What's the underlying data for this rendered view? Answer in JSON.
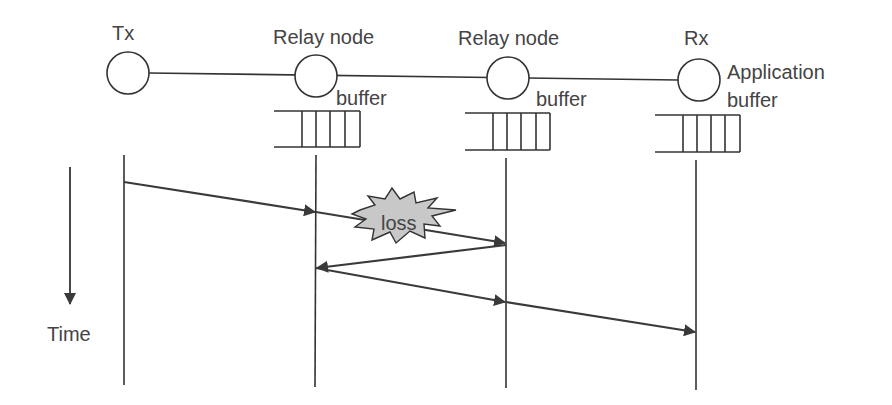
{
  "nodes": [
    {
      "id": "tx",
      "label": "Tx"
    },
    {
      "id": "relay1",
      "label": "Relay node",
      "buffer_label": "buffer"
    },
    {
      "id": "relay2",
      "label": "Relay node",
      "buffer_label": "buffer"
    },
    {
      "id": "rx",
      "label": "Rx",
      "buffer_label_line1": "Application",
      "buffer_label_line2": "buffer"
    }
  ],
  "time_axis": {
    "label": "Time"
  },
  "loss": {
    "label": "loss"
  },
  "messages": [
    {
      "from": "tx",
      "to": "relay1",
      "note": "packet"
    },
    {
      "from": "relay1",
      "to": "relay2",
      "note": "lost packet"
    },
    {
      "from": "relay2",
      "to": "relay1",
      "note": "feedback"
    },
    {
      "from": "relay1",
      "to": "relay2",
      "note": "retransmission"
    },
    {
      "from": "relay2",
      "to": "rx",
      "note": "forward"
    }
  ],
  "colors": {
    "line": "#333333",
    "arrow": "#3a3a3a",
    "loss_fill": "#c8c8c8",
    "text": "#444444"
  }
}
